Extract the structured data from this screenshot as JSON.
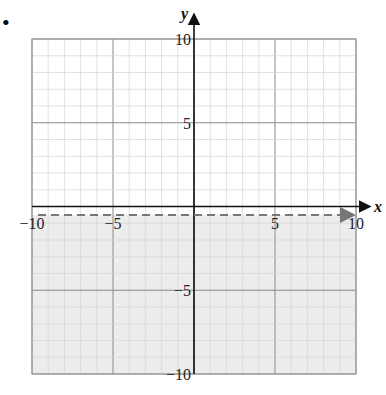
{
  "problem_marker": "•",
  "chart_data": {
    "type": "inequality-graph",
    "title": "",
    "xlabel": "x",
    "ylabel": "y",
    "xlim": [
      -10,
      10
    ],
    "ylim": [
      -10,
      10
    ],
    "grid": true,
    "minor_grid_step": 1,
    "major_grid_step": 5,
    "x_tick_labels": [
      "-10",
      "-5",
      "5",
      "10"
    ],
    "y_tick_labels": [
      "10",
      "5",
      "-5",
      "-10"
    ],
    "boundary_line": {
      "equation": "y = -0.5",
      "style": "dashed",
      "arrows": "both",
      "y": -0.5
    },
    "shaded_region": "below",
    "inequality": "y < -0.5"
  },
  "colors": {
    "shade": "#ececec",
    "minor_grid": "#d4d4d4",
    "major_grid": "#8a8a8a",
    "axis": "#111111",
    "dash": "#777777"
  }
}
